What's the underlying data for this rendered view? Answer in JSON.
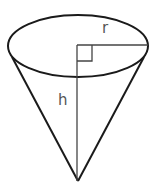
{
  "diagram": {
    "labels": {
      "radius": "r",
      "height": "h"
    },
    "shapes": {
      "base": {
        "type": "ellipse",
        "cx": 78,
        "cy": 46,
        "rx": 70,
        "ry": 31
      },
      "apex": {
        "x": 78,
        "y": 181
      },
      "left_tangent": {
        "x": 12,
        "y": 57
      },
      "right_tangent": {
        "x": 144,
        "y": 57
      },
      "center": {
        "x": 78,
        "y": 45
      },
      "right_angle_marker_size": 15
    },
    "colors": {
      "outline": "#1a1a1a",
      "inner_line": "#444444",
      "label": "#555555",
      "background": "#ffffff"
    }
  }
}
